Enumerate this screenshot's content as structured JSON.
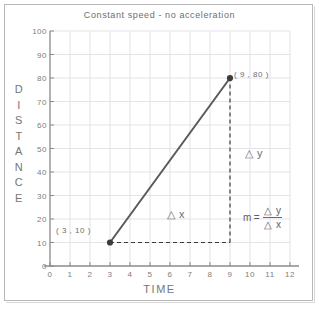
{
  "chart_data": {
    "type": "line",
    "title": "Constant speed - no acceleration",
    "xlabel": "TIME",
    "ylabel": "DISTANCE",
    "xlim": [
      0,
      12
    ],
    "ylim": [
      0,
      100
    ],
    "xticks": [
      "0",
      "1",
      "2",
      "3",
      "4",
      "5",
      "6",
      "7",
      "8",
      "9",
      "10",
      "11",
      "12"
    ],
    "yticks": [
      "0",
      "10",
      "20",
      "30",
      "40",
      "50",
      "60",
      "70",
      "80",
      "90",
      "100"
    ],
    "grid": true,
    "legend": "none",
    "series": [
      {
        "name": "distance vs time",
        "x": [
          3,
          9
        ],
        "y": [
          10,
          80
        ],
        "markers": true,
        "color": "#5a5a5a"
      }
    ],
    "points": [
      {
        "x": 3,
        "y": 10,
        "label": "( 3 , 10 )"
      },
      {
        "x": 9,
        "y": 80,
        "label": "( 9 , 80 )"
      }
    ],
    "annotations": {
      "delta_y": "△ y",
      "delta_x": "△ x",
      "slope_lhs": "m",
      "slope_equals": "=",
      "slope_numerator": "△ y",
      "slope_denominator": "△ x"
    },
    "guides": [
      {
        "name": "horizontal-dashed-guide",
        "from": [
          3,
          10
        ],
        "to": [
          9,
          10
        ],
        "style": "dashed"
      },
      {
        "name": "vertical-dashed-guide",
        "from": [
          9,
          10
        ],
        "to": [
          9,
          80
        ],
        "style": "dashed"
      }
    ],
    "colors": {
      "grid": "#e3e3e8",
      "axis": "#8a8a8a",
      "line": "#5a5a5a",
      "marker": "#3c3c3c",
      "text": "#6e6e6e",
      "frame": "#b8b8b8",
      "background": "#ffffff"
    }
  }
}
